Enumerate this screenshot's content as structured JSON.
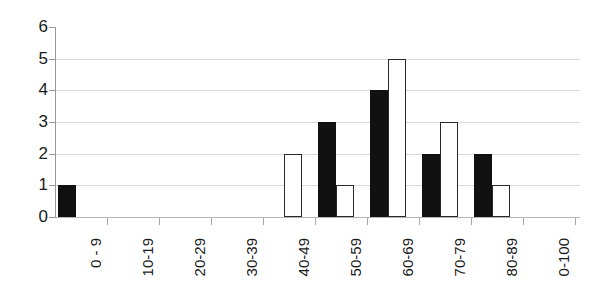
{
  "chart_data": {
    "type": "bar",
    "title": "",
    "subtitle": "",
    "xlabel": "",
    "ylabel": "",
    "categories": [
      "0 - 9",
      "10-19",
      "20-29",
      "30-39",
      "40-49",
      "50-59",
      "60-69",
      "70-79",
      "80-89",
      "0-100"
    ],
    "series": [
      {
        "name": "black",
        "color": "#111111",
        "values": [
          1,
          0,
          0,
          0,
          0,
          3,
          4,
          2,
          2,
          0
        ]
      },
      {
        "name": "white",
        "color": "#ffffff",
        "values": [
          0,
          0,
          0,
          0,
          2,
          1,
          5,
          3,
          1,
          0
        ]
      }
    ],
    "ylim": [
      0,
      6
    ],
    "y_ticks": [
      0,
      1,
      2,
      3,
      4,
      5,
      6
    ],
    "y_tick_labels": [
      "0",
      "1",
      "2",
      "3",
      "4",
      "5",
      "6"
    ],
    "grid": true,
    "grid_axis": "y",
    "legend": false,
    "legend_position": "none",
    "bar_style": "grouped"
  },
  "axes": {
    "y_axis_name": "value-axis",
    "x_axis_name": "category-axis"
  }
}
